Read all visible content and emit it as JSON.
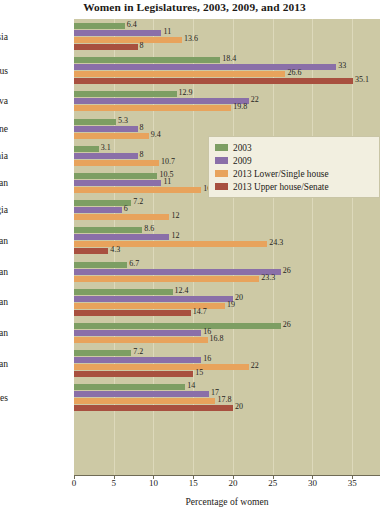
{
  "chart_data": {
    "type": "bar",
    "orientation": "horizontal",
    "title": "Women in Legislatures, 2003, 2009, and 2013",
    "xlabel": "Percentage of women",
    "ylabel": "",
    "xlim": [
      0,
      38.5
    ],
    "xticks": [
      0,
      5,
      10,
      15,
      20,
      25,
      30,
      35
    ],
    "xtick_labels": [
      "0",
      "5",
      "10",
      "15",
      "20",
      "25",
      "30",
      "35"
    ],
    "grid": true,
    "grid_axis": "x",
    "legend_position": "center-right",
    "categories": [
      "Russia",
      "Belarus",
      "Moldova",
      "Ukraine",
      "Armenia",
      "Azerbaijan",
      "Georgia",
      "Kazakhstan",
      "Kyrgyzstan",
      "Tajikistan",
      "Turkmenistan",
      "Uzbekistan",
      "United States"
    ],
    "series": [
      {
        "name": "2003",
        "color": "#7d9e63",
        "values": [
          6.4,
          18.4,
          12.9,
          5.3,
          3.1,
          10.5,
          7.2,
          8.6,
          6.7,
          12.4,
          26,
          7.2,
          14
        ]
      },
      {
        "name": "2009",
        "color": "#8a6fa8",
        "values": [
          11,
          33,
          22,
          8,
          8,
          11,
          6,
          12,
          26,
          20,
          16,
          16,
          17
        ]
      },
      {
        "name": "2013 Lower/Single house",
        "color": "#e8a35c",
        "values": [
          13.6,
          26.6,
          19.8,
          9.4,
          10.7,
          16,
          12,
          24.3,
          23.3,
          19,
          16.8,
          22,
          17.8
        ]
      },
      {
        "name": "2013 Upper house/Senate",
        "color": "#a8503f",
        "values": [
          8,
          35.1,
          null,
          null,
          null,
          null,
          null,
          4.3,
          null,
          14.7,
          null,
          15,
          20
        ]
      }
    ],
    "value_labels": {
      "Russia": [
        "6.4",
        "11",
        "13.6",
        "8"
      ],
      "Belarus": [
        "18.4",
        "33",
        "26.6",
        "35.1"
      ],
      "Moldova": [
        "12.9",
        "22",
        "19.8",
        ""
      ],
      "Ukraine": [
        "5.3",
        "8",
        "9.4",
        ""
      ],
      "Armenia": [
        "3.1",
        "8",
        "10.7",
        ""
      ],
      "Azerbaijan": [
        "10.5",
        "11",
        "16",
        ""
      ],
      "Georgia": [
        "7.2",
        "6",
        "12",
        ""
      ],
      "Kazakhstan": [
        "8.6",
        "12",
        "24.3",
        "4.3"
      ],
      "Kyrgyzstan": [
        "6.7",
        "26",
        "23.3",
        ""
      ],
      "Tajikistan": [
        "12.4",
        "20",
        "19",
        "14.7"
      ],
      "Turkmenistan": [
        "26",
        "16",
        "16.8",
        ""
      ],
      "Uzbekistan": [
        "7.2",
        "16",
        "22",
        "15"
      ],
      "United States": [
        "14",
        "17",
        "17.8",
        "20"
      ]
    }
  },
  "colors": {
    "plot_background": "#cdc9a5",
    "gridline": "#ddd9bb",
    "page_background": "#ffffff",
    "axis": "#6f6b55",
    "text": "#1d1a16",
    "legend_background": "#f2efe0",
    "legend_border": "#c9c5a6"
  }
}
